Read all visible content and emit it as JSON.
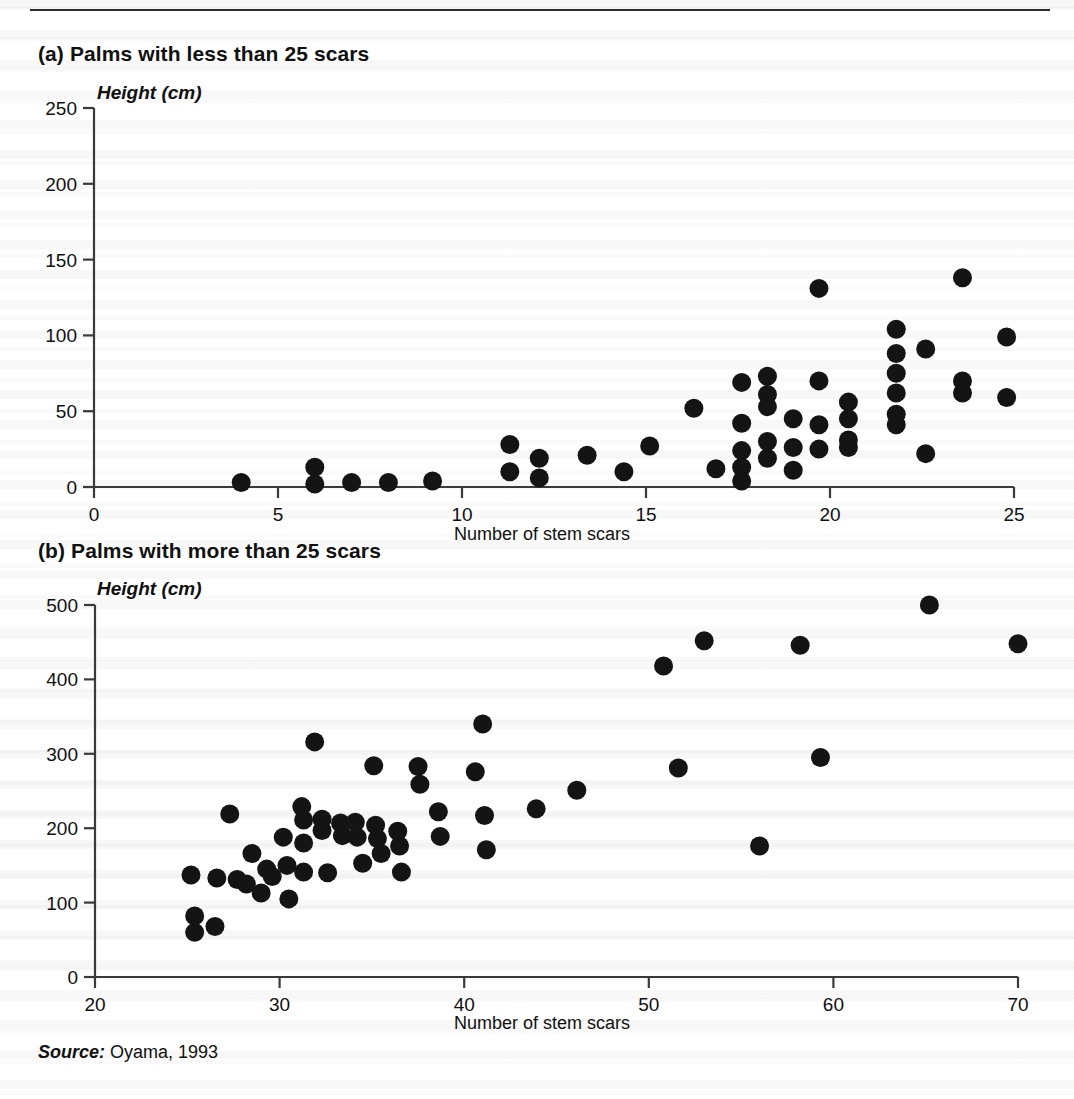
{
  "figure": {
    "source_label": "Source:",
    "source_text": " Oyama, 1993",
    "rule_color": "#2c2c2c",
    "marker_color": "#141414",
    "axis_color": "#3a3a3a"
  },
  "panel_a": {
    "title": "(a) Palms with less than 25 scars",
    "y_axis_title": "Height (cm)",
    "x_axis_label": "Number of stem scars"
  },
  "panel_b": {
    "title": "(b) Palms with more than 25 scars",
    "y_axis_title": "Height (cm)",
    "x_axis_label": "Number of stem scars"
  },
  "chart_data": [
    {
      "type": "scatter",
      "title": "(a) Palms with less than 25 scars",
      "xlabel": "Number of stem scars",
      "ylabel": "Height (cm)",
      "xlim": [
        0,
        25
      ],
      "ylim": [
        0,
        250
      ],
      "xticks": [
        0,
        5,
        10,
        15,
        20,
        25
      ],
      "yticks": [
        0,
        50,
        100,
        150,
        200,
        250
      ],
      "grid": false,
      "legend": "none",
      "points": [
        {
          "x": 4.0,
          "y": 3
        },
        {
          "x": 6.0,
          "y": 13
        },
        {
          "x": 6.0,
          "y": 2
        },
        {
          "x": 7.0,
          "y": 3
        },
        {
          "x": 8.0,
          "y": 3
        },
        {
          "x": 9.2,
          "y": 4
        },
        {
          "x": 11.3,
          "y": 28
        },
        {
          "x": 11.3,
          "y": 10
        },
        {
          "x": 12.1,
          "y": 19
        },
        {
          "x": 12.1,
          "y": 6
        },
        {
          "x": 13.4,
          "y": 21
        },
        {
          "x": 14.4,
          "y": 10
        },
        {
          "x": 15.1,
          "y": 27
        },
        {
          "x": 16.3,
          "y": 52
        },
        {
          "x": 16.9,
          "y": 12
        },
        {
          "x": 17.6,
          "y": 69
        },
        {
          "x": 17.6,
          "y": 42
        },
        {
          "x": 17.6,
          "y": 24
        },
        {
          "x": 17.6,
          "y": 13
        },
        {
          "x": 17.6,
          "y": 4
        },
        {
          "x": 18.3,
          "y": 73
        },
        {
          "x": 18.3,
          "y": 61
        },
        {
          "x": 18.3,
          "y": 53
        },
        {
          "x": 18.3,
          "y": 30
        },
        {
          "x": 18.3,
          "y": 19
        },
        {
          "x": 19.0,
          "y": 45
        },
        {
          "x": 19.0,
          "y": 26
        },
        {
          "x": 19.0,
          "y": 11
        },
        {
          "x": 19.7,
          "y": 131
        },
        {
          "x": 19.7,
          "y": 70
        },
        {
          "x": 19.7,
          "y": 41
        },
        {
          "x": 19.7,
          "y": 25
        },
        {
          "x": 20.5,
          "y": 56
        },
        {
          "x": 20.5,
          "y": 45
        },
        {
          "x": 20.5,
          "y": 26
        },
        {
          "x": 20.5,
          "y": 31
        },
        {
          "x": 21.8,
          "y": 104
        },
        {
          "x": 21.8,
          "y": 88
        },
        {
          "x": 21.8,
          "y": 75
        },
        {
          "x": 21.8,
          "y": 62
        },
        {
          "x": 21.8,
          "y": 48
        },
        {
          "x": 21.8,
          "y": 41
        },
        {
          "x": 22.6,
          "y": 91
        },
        {
          "x": 22.6,
          "y": 22
        },
        {
          "x": 23.6,
          "y": 138
        },
        {
          "x": 23.6,
          "y": 70
        },
        {
          "x": 23.6,
          "y": 62
        },
        {
          "x": 24.8,
          "y": 99
        },
        {
          "x": 24.8,
          "y": 59
        }
      ]
    },
    {
      "type": "scatter",
      "title": "(b) Palms with more than 25 scars",
      "xlabel": "Number of stem scars",
      "ylabel": "Height (cm)",
      "xlim": [
        20,
        70
      ],
      "ylim": [
        0,
        500
      ],
      "xticks": [
        20,
        30,
        40,
        50,
        60,
        70
      ],
      "yticks": [
        0,
        100,
        200,
        300,
        400,
        500
      ],
      "grid": false,
      "legend": "none",
      "points": [
        {
          "x": 25.2,
          "y": 137
        },
        {
          "x": 25.4,
          "y": 82
        },
        {
          "x": 25.4,
          "y": 60
        },
        {
          "x": 26.5,
          "y": 68
        },
        {
          "x": 26.6,
          "y": 133
        },
        {
          "x": 27.3,
          "y": 219
        },
        {
          "x": 27.7,
          "y": 131
        },
        {
          "x": 28.2,
          "y": 125
        },
        {
          "x": 28.5,
          "y": 166
        },
        {
          "x": 29.0,
          "y": 113
        },
        {
          "x": 29.3,
          "y": 145
        },
        {
          "x": 29.6,
          "y": 135
        },
        {
          "x": 30.2,
          "y": 188
        },
        {
          "x": 30.4,
          "y": 150
        },
        {
          "x": 30.5,
          "y": 105
        },
        {
          "x": 31.2,
          "y": 229
        },
        {
          "x": 31.3,
          "y": 211
        },
        {
          "x": 31.3,
          "y": 180
        },
        {
          "x": 31.3,
          "y": 141
        },
        {
          "x": 31.9,
          "y": 316
        },
        {
          "x": 32.3,
          "y": 212
        },
        {
          "x": 32.3,
          "y": 197
        },
        {
          "x": 32.6,
          "y": 140
        },
        {
          "x": 33.3,
          "y": 207
        },
        {
          "x": 33.4,
          "y": 190
        },
        {
          "x": 34.1,
          "y": 208
        },
        {
          "x": 34.2,
          "y": 188
        },
        {
          "x": 34.5,
          "y": 153
        },
        {
          "x": 35.1,
          "y": 284
        },
        {
          "x": 35.2,
          "y": 204
        },
        {
          "x": 35.3,
          "y": 186
        },
        {
          "x": 35.5,
          "y": 166
        },
        {
          "x": 36.4,
          "y": 196
        },
        {
          "x": 36.5,
          "y": 176
        },
        {
          "x": 36.6,
          "y": 141
        },
        {
          "x": 37.5,
          "y": 283
        },
        {
          "x": 37.6,
          "y": 259
        },
        {
          "x": 38.6,
          "y": 222
        },
        {
          "x": 38.7,
          "y": 189
        },
        {
          "x": 40.6,
          "y": 276
        },
        {
          "x": 41.0,
          "y": 340
        },
        {
          "x": 41.1,
          "y": 217
        },
        {
          "x": 41.2,
          "y": 171
        },
        {
          "x": 43.9,
          "y": 226
        },
        {
          "x": 46.1,
          "y": 251
        },
        {
          "x": 50.8,
          "y": 418
        },
        {
          "x": 51.6,
          "y": 281
        },
        {
          "x": 53.0,
          "y": 452
        },
        {
          "x": 56.0,
          "y": 176
        },
        {
          "x": 58.2,
          "y": 446
        },
        {
          "x": 59.3,
          "y": 295
        },
        {
          "x": 65.2,
          "y": 500
        },
        {
          "x": 70.0,
          "y": 448
        }
      ]
    }
  ]
}
